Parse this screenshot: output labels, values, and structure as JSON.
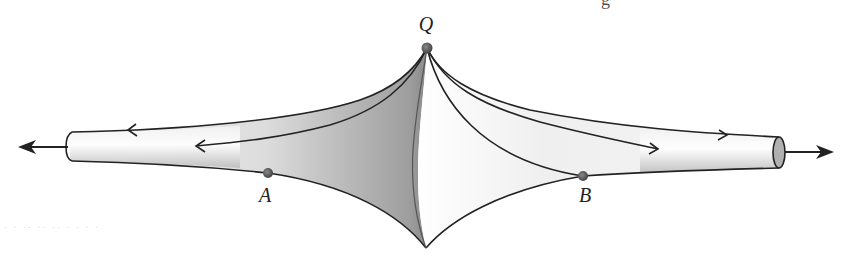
{
  "figure": {
    "points": {
      "Q": {
        "label": "Q",
        "x": 427,
        "y": 48,
        "label_x": 426,
        "label_y": 12
      },
      "A": {
        "label": "A",
        "x": 268,
        "y": 173,
        "label_x": 265,
        "label_y": 186
      },
      "B": {
        "label": "B",
        "x": 583,
        "y": 176,
        "label_x": 585,
        "label_y": 186
      }
    },
    "colors": {
      "outline": "#222222",
      "dot": "#555555",
      "surface_light": "#ffffff",
      "surface_dark": "#9a9a9a",
      "tube_end": "#b0b0b0"
    },
    "partial_header_text": "g",
    "faint_bleed_text": "· · ·· ·· ·· · · · ·"
  }
}
